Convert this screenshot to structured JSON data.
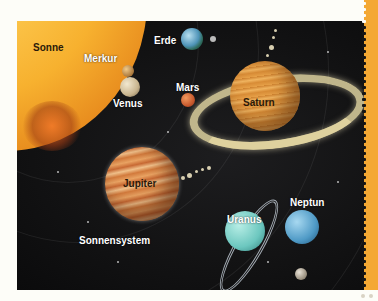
{
  "illustration": {
    "title": "Sonnensystem",
    "labels": {
      "sun": "Sonne",
      "mercury": "Merkur",
      "venus": "Venus",
      "earth": "Erde",
      "mars": "Mars",
      "jupiter": "Jupiter",
      "saturn": "Saturn",
      "uranus": "Uranus",
      "neptune": "Neptun"
    }
  },
  "colors": {
    "space": "#121213",
    "strip": "#f4a833",
    "background": "#fdfdf8",
    "sun": "#f7b12f"
  }
}
